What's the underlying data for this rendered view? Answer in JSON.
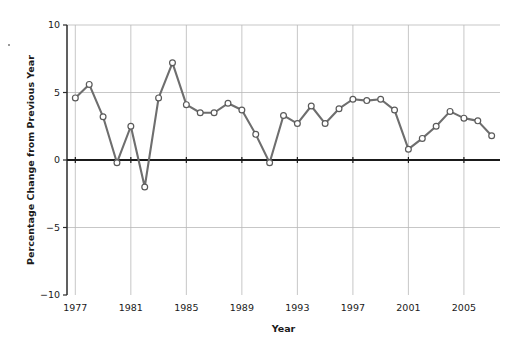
{
  "chart_data": {
    "type": "line",
    "title": "",
    "xlabel": "Year",
    "ylabel": "Percentage Change from Previous Year",
    "xlim": [
      1976.4,
      2007.6
    ],
    "ylim": [
      -10,
      10
    ],
    "yticks": [
      -10,
      -5,
      0,
      5,
      10
    ],
    "ytick_labels": [
      "−10",
      "−5",
      "0",
      "5",
      "10"
    ],
    "xticks": [
      1977,
      1981,
      1985,
      1989,
      1993,
      1997,
      2001,
      2005
    ],
    "xtick_labels": [
      "1977",
      "1981",
      "1985",
      "1989",
      "1993",
      "1997",
      "2001",
      "2005"
    ],
    "grid": "both-major",
    "gridlines_y": [
      10,
      5,
      -5
    ],
    "zero_line": 0,
    "legend": "none",
    "marker": "open-circle",
    "line_color": "#6e6e6e",
    "marker_face_color": "#ffffff",
    "marker_edge_color": "#5a5a5a",
    "x": [
      1977,
      1978,
      1979,
      1980,
      1981,
      1982,
      1983,
      1984,
      1985,
      1986,
      1987,
      1988,
      1989,
      1990,
      1991,
      1992,
      1993,
      1994,
      1995,
      1996,
      1997,
      1998,
      1999,
      2000,
      2001,
      2002,
      2003,
      2004,
      2005,
      2006,
      2007
    ],
    "values": [
      4.6,
      5.6,
      3.2,
      -0.2,
      2.5,
      -2.0,
      4.6,
      7.2,
      4.1,
      3.5,
      3.5,
      4.2,
      3.7,
      1.9,
      -0.2,
      3.3,
      2.7,
      4.0,
      2.7,
      3.8,
      4.5,
      4.4,
      4.5,
      3.7,
      0.8,
      1.6,
      2.5,
      3.6,
      3.1,
      2.9,
      1.8
    ]
  }
}
